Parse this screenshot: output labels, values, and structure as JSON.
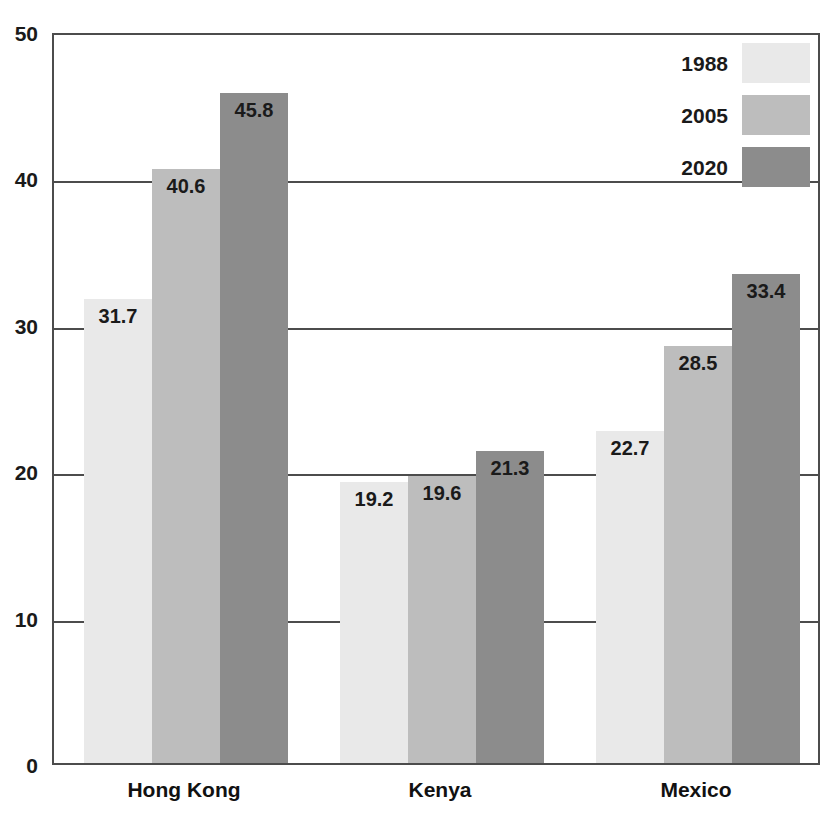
{
  "chart_data": {
    "type": "bar",
    "title": "",
    "xlabel": "",
    "ylabel": "",
    "ylim": [
      0,
      50
    ],
    "yticks": [
      0,
      10,
      20,
      30,
      40,
      50
    ],
    "ytick_labels": [
      "0",
      "10",
      "20",
      "30",
      "40",
      "50"
    ],
    "grid": true,
    "legend_position": "top-right-inside",
    "categories": [
      "Hong Kong",
      "Kenya",
      "Mexico"
    ],
    "series": [
      {
        "name": "1988",
        "color": "#e9e9e9",
        "values": [
          31.7,
          19.2,
          22.7
        ],
        "labels": [
          "31.7",
          "19.2",
          "22.7"
        ]
      },
      {
        "name": "2005",
        "color": "#bdbdbd",
        "values": [
          40.6,
          19.6,
          28.5
        ],
        "labels": [
          "40.6",
          "19.6",
          "28.5"
        ]
      },
      {
        "name": "2020",
        "color": "#8c8c8c",
        "values": [
          45.8,
          21.3,
          33.4
        ],
        "labels": [
          "45.8",
          "21.3",
          "33.4"
        ]
      }
    ]
  },
  "axis": {
    "frame_color": "#4c4c4c",
    "text_color": "#1a1a1a"
  }
}
